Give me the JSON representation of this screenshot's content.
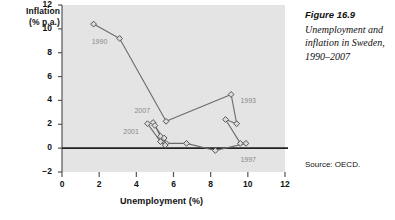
{
  "caption": {
    "figure_number": "Figure 16.9",
    "text": "Unemployment and inflation in Sweden, 1990–2007"
  },
  "source": "Source: OECD.",
  "axis": {
    "y_title_line1": "Inflation",
    "y_title_line2": "(% p.a.)",
    "x_title": "Unemployment (%)"
  },
  "chart_data": {
    "type": "scatter",
    "title": "Unemployment and inflation in Sweden, 1990–2007",
    "xlabel": "Unemployment (%)",
    "ylabel": "Inflation (% p.a.)",
    "xlim": [
      0,
      12
    ],
    "ylim": [
      -2,
      12
    ],
    "xticks": [
      "0",
      "2",
      "4",
      "6",
      "8",
      "10",
      "12"
    ],
    "yticks": [
      "12",
      "10",
      "8",
      "6",
      "4",
      "2",
      "0",
      "−2"
    ],
    "grid": false,
    "legend": "none",
    "connected": true,
    "marker": "diamond-open",
    "series_name": "Sweden 1990–2007",
    "points": [
      {
        "year": "1990",
        "x": 1.7,
        "y": 10.4
      },
      {
        "year": "1991",
        "x": 3.1,
        "y": 9.2
      },
      {
        "year": "1992",
        "x": 5.6,
        "y": 2.25
      },
      {
        "year": "1993",
        "x": 9.1,
        "y": 4.5
      },
      {
        "year": "1994",
        "x": 9.4,
        "y": 2.05
      },
      {
        "year": "1995",
        "x": 8.8,
        "y": 2.4
      },
      {
        "year": "1996",
        "x": 9.6,
        "y": 0.4
      },
      {
        "year": "1997",
        "x": 9.9,
        "y": 0.4
      },
      {
        "year": "1998",
        "x": 8.25,
        "y": -0.2
      },
      {
        "year": "1999",
        "x": 6.7,
        "y": 0.4
      },
      {
        "year": "2000",
        "x": 5.6,
        "y": 0.4
      },
      {
        "year": "2001",
        "x": 4.9,
        "y": 2.15
      },
      {
        "year": "2002",
        "x": 5.0,
        "y": 1.9
      },
      {
        "year": "2003",
        "x": 5.3,
        "y": 1.0
      },
      {
        "year": "2004",
        "x": 5.5,
        "y": 0.85
      },
      {
        "year": "2005",
        "x": 5.55,
        "y": 0.25
      },
      {
        "year": "2006",
        "x": 5.3,
        "y": 0.55
      },
      {
        "year": "2007",
        "x": 4.6,
        "y": 2.05
      }
    ],
    "annotations": [
      {
        "label": "1990",
        "x": 1.6,
        "y": 8.8
      },
      {
        "label": "1993",
        "x": 9.6,
        "y": 3.9
      },
      {
        "label": "1997",
        "x": 9.6,
        "y": -1.1
      },
      {
        "label": "2001",
        "x": 3.3,
        "y": 1.3
      },
      {
        "label": "2007",
        "x": 3.9,
        "y": 3.0
      }
    ],
    "colors": {
      "plot_background": "#e4e4e4",
      "line": "#6b6b6b",
      "marker_fill": "#dcdcdc",
      "marker_edge": "#555555",
      "axis": "#555555",
      "zero_line": "#222222",
      "annotation_text": "#8a8a8a"
    }
  }
}
